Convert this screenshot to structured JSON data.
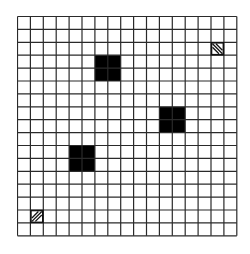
{
  "board": {
    "rows": 17,
    "cols": 17,
    "cell_size": 12.9,
    "line_color": "#2a2a2a",
    "background": "#ffffff",
    "block_color": "#000000",
    "obstacles": [
      {
        "row": 3,
        "col": 6,
        "width": 2,
        "height": 2
      },
      {
        "row": 7,
        "col": 11,
        "width": 2,
        "height": 2
      },
      {
        "row": 10,
        "col": 4,
        "width": 2,
        "height": 2
      }
    ],
    "markers": [
      {
        "name": "goal-marker",
        "row": 2,
        "col": 15,
        "hatch": "backslash"
      },
      {
        "name": "start-marker",
        "row": 15,
        "col": 1,
        "hatch": "slash"
      }
    ]
  }
}
